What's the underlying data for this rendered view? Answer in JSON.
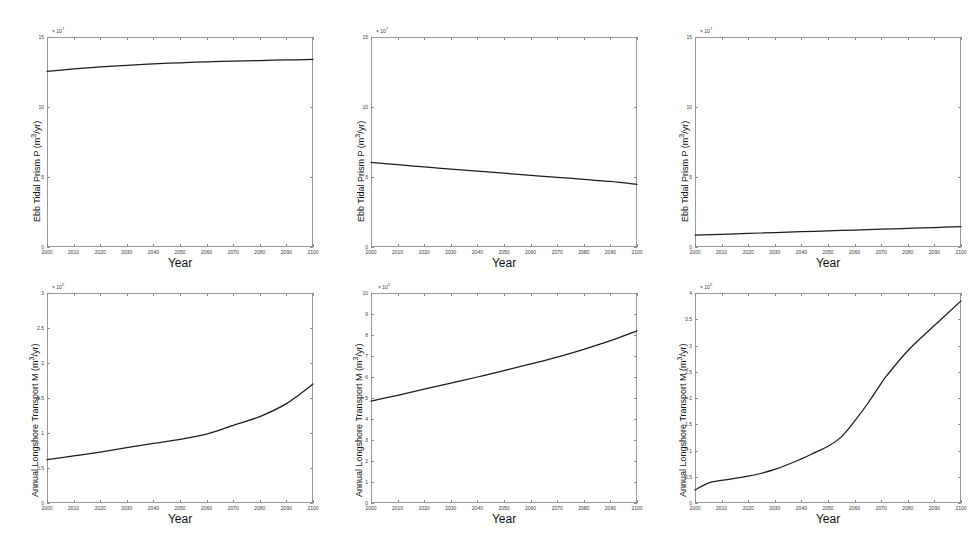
{
  "figure": {
    "width": 972,
    "height": 549,
    "background": "#ffffff",
    "line_color": "#1c1c1c",
    "axis_color": "#9a9a9a",
    "rows": 2,
    "cols": 3
  },
  "chart_data": [
    {
      "id": "panel-1",
      "type": "line",
      "title": "",
      "xlabel": "Year",
      "ylabel": "Ebb Tidal Prism P (m3/yr)",
      "ylabel_html": "Ebb Tidal Prism P (m<sup>3</sup>/yr)",
      "y_exponent": "x 10",
      "y_exponent_power": "7",
      "y_exponent_label": "x 10^7",
      "xlim": [
        2000,
        2100
      ],
      "ylim": [
        0,
        15
      ],
      "xticks": [
        2000,
        2010,
        2020,
        2030,
        2040,
        2050,
        2060,
        2070,
        2080,
        2090,
        2100
      ],
      "xticklabels": [
        "2000",
        "2010",
        "2020",
        "2030",
        "2040",
        "2050",
        "2060",
        "2070",
        "2080",
        "2090",
        "2100"
      ],
      "yticks": [
        0,
        5,
        10,
        15
      ],
      "yticklabels": [
        "0",
        "5",
        "10",
        "15"
      ],
      "grid": false,
      "legend": "none",
      "x": [
        2000,
        2010,
        2020,
        2030,
        2040,
        2050,
        2060,
        2070,
        2080,
        2090,
        2100
      ],
      "y": [
        12.55,
        12.72,
        12.86,
        12.98,
        13.08,
        13.16,
        13.23,
        13.28,
        13.32,
        13.36,
        13.4
      ]
    },
    {
      "id": "panel-2",
      "type": "line",
      "title": "",
      "xlabel": "Year",
      "ylabel": "Ebb Tidal Prism P (m3/yr)",
      "ylabel_html": "Ebb Tidal Prism P (m<sup>3</sup>/yr)",
      "y_exponent": "x 10",
      "y_exponent_power": "7",
      "y_exponent_label": "x 10^7",
      "xlim": [
        2000,
        2100
      ],
      "ylim": [
        0,
        15
      ],
      "xticks": [
        2000,
        2010,
        2020,
        2030,
        2040,
        2050,
        2060,
        2070,
        2080,
        2090,
        2100
      ],
      "xticklabels": [
        "2000",
        "2010",
        "2020",
        "2030",
        "2040",
        "2050",
        "2060",
        "2070",
        "2080",
        "2090",
        "2100"
      ],
      "yticks": [
        0,
        5,
        10,
        15
      ],
      "yticklabels": [
        "0",
        "5",
        "10",
        "15"
      ],
      "grid": false,
      "legend": "none",
      "x": [
        2000,
        2010,
        2020,
        2030,
        2040,
        2050,
        2060,
        2070,
        2080,
        2090,
        2100
      ],
      "y": [
        6.05,
        5.88,
        5.72,
        5.57,
        5.42,
        5.27,
        5.12,
        4.98,
        4.83,
        4.68,
        4.48
      ]
    },
    {
      "id": "panel-3",
      "type": "line",
      "title": "",
      "xlabel": "Year",
      "ylabel": "Ebb Tidal Prism P (m3/yr)",
      "ylabel_html": "Ebb Tidal Prism P (m<sup>3</sup>/yr)",
      "y_exponent": "x 10",
      "y_exponent_power": "7",
      "y_exponent_label": "x 10^7",
      "xlim": [
        2000,
        2100
      ],
      "ylim": [
        0,
        15
      ],
      "xticks": [
        2000,
        2010,
        2020,
        2030,
        2040,
        2050,
        2060,
        2070,
        2080,
        2090,
        2100
      ],
      "xticklabels": [
        "2000",
        "2010",
        "2020",
        "2030",
        "2040",
        "2050",
        "2060",
        "2070",
        "2080",
        "2090",
        "2100"
      ],
      "yticks": [
        0,
        5,
        10,
        15
      ],
      "yticklabels": [
        "0",
        "5",
        "10",
        "15"
      ],
      "grid": false,
      "legend": "none",
      "x": [
        2000,
        2010,
        2020,
        2030,
        2040,
        2050,
        2060,
        2070,
        2080,
        2090,
        2100
      ],
      "y": [
        0.85,
        0.91,
        0.97,
        1.03,
        1.09,
        1.15,
        1.21,
        1.27,
        1.33,
        1.39,
        1.45
      ]
    },
    {
      "id": "panel-4",
      "type": "line",
      "title": "",
      "xlabel": "Year",
      "ylabel": "Annual Longshore Transport M (m3/yr)",
      "ylabel_html": "Annual Longshore Transport M (m<sup>3</sup>/yr)",
      "y_exponent": "x 10",
      "y_exponent_power": "5",
      "y_exponent_label": "x 10^5",
      "xlim": [
        2000,
        2100
      ],
      "ylim": [
        0,
        3
      ],
      "xticks": [
        2000,
        2010,
        2020,
        2030,
        2040,
        2050,
        2060,
        2070,
        2080,
        2090,
        2100
      ],
      "xticklabels": [
        "2000",
        "2010",
        "2020",
        "2030",
        "2040",
        "2050",
        "2060",
        "2070",
        "2080",
        "2090",
        "2100"
      ],
      "yticks": [
        0,
        0.5,
        1,
        1.5,
        2,
        2.5,
        3
      ],
      "yticklabels": [
        "0",
        "0.5",
        "1",
        "1.5",
        "2",
        "2.5",
        "3"
      ],
      "grid": false,
      "legend": "none",
      "x": [
        2000,
        2010,
        2020,
        2030,
        2040,
        2050,
        2060,
        2070,
        2080,
        2090,
        2100
      ],
      "y": [
        0.62,
        0.672,
        0.728,
        0.79,
        0.852,
        0.91,
        0.985,
        1.11,
        1.235,
        1.42,
        1.7
      ]
    },
    {
      "id": "panel-5",
      "type": "line",
      "title": "",
      "xlabel": "Year",
      "ylabel": "Annual Longshore Transport M (m3/yr)",
      "ylabel_html": "Annual Longshore Transport M (m<sup>3</sup>/yr)",
      "y_exponent": "x 10",
      "y_exponent_power": "5",
      "y_exponent_label": "x 10^5",
      "xlim": [
        2000,
        2100
      ],
      "ylim": [
        0,
        10
      ],
      "xticks": [
        2000,
        2010,
        2020,
        2030,
        2040,
        2050,
        2060,
        2070,
        2080,
        2090,
        2100
      ],
      "xticklabels": [
        "2000",
        "2010",
        "2020",
        "2030",
        "2040",
        "2050",
        "2060",
        "2070",
        "2080",
        "2090",
        "2100"
      ],
      "yticks": [
        0,
        1,
        2,
        3,
        4,
        5,
        6,
        7,
        8,
        9,
        10
      ],
      "yticklabels": [
        "0",
        "1",
        "2",
        "3",
        "4",
        "5",
        "6",
        "7",
        "8",
        "9",
        "10"
      ],
      "grid": false,
      "legend": "none",
      "x": [
        2000,
        2010,
        2020,
        2030,
        2040,
        2050,
        2060,
        2070,
        2080,
        2090,
        2100
      ],
      "y": [
        4.85,
        5.13,
        5.42,
        5.71,
        6.0,
        6.3,
        6.62,
        6.95,
        7.32,
        7.73,
        8.2
      ]
    },
    {
      "id": "panel-6",
      "type": "line",
      "title": "",
      "xlabel": "Year",
      "ylabel": "Annual Longshore Transport M (m3/yr)",
      "ylabel_html": "Annual Longshore Transport M (m<sup>3</sup>/yr)",
      "y_exponent": "x 10",
      "y_exponent_power": "5",
      "y_exponent_label": "x 10^5",
      "xlim": [
        2000,
        2100
      ],
      "ylim": [
        0,
        4
      ],
      "xticks": [
        2000,
        2010,
        2020,
        2030,
        2040,
        2050,
        2060,
        2070,
        2080,
        2090,
        2100
      ],
      "xticklabels": [
        "2000",
        "2010",
        "2020",
        "2030",
        "2040",
        "2050",
        "2060",
        "2070",
        "2080",
        "2090",
        "2100"
      ],
      "yticks": [
        0,
        0.5,
        1,
        1.5,
        2,
        2.5,
        3,
        3.5,
        4
      ],
      "yticklabels": [
        "0",
        "0.5",
        "1",
        "1.5",
        "2",
        "2.5",
        "3",
        "3.5",
        "4"
      ],
      "grid": false,
      "legend": "none",
      "x": [
        2000,
        2005,
        2010,
        2020,
        2030,
        2040,
        2045,
        2050,
        2055,
        2060,
        2065,
        2070,
        2072,
        2080,
        2090,
        2100
      ],
      "y": [
        0.25,
        0.38,
        0.43,
        0.51,
        0.64,
        0.84,
        0.96,
        1.08,
        1.26,
        1.56,
        1.9,
        2.28,
        2.42,
        2.9,
        3.38,
        3.85
      ]
    }
  ]
}
